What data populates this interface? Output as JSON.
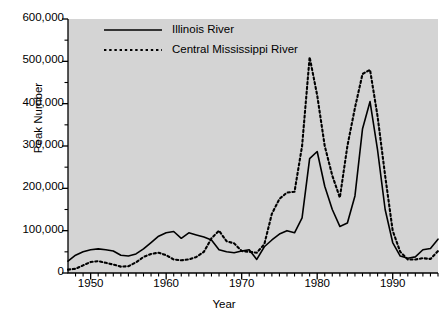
{
  "chart_data": {
    "type": "line",
    "title": "",
    "xlabel": "Year",
    "ylabel": "Peak Number",
    "xlim": [
      1947,
      1996
    ],
    "ylim": [
      0,
      600000
    ],
    "grid": false,
    "legend_position": "top-center",
    "y_ticks": [
      0,
      100000,
      200000,
      300000,
      400000,
      500000,
      600000
    ],
    "y_tick_labels": [
      "0",
      "100,000",
      "200,000",
      "300,000",
      "400,000",
      "500,000",
      "600,000"
    ],
    "x_ticks": [
      1950,
      1960,
      1970,
      1980,
      1990
    ],
    "x_tick_labels": [
      "1950",
      "1960",
      "1970",
      "1980",
      "1990"
    ],
    "x_minor_tick_interval": 1,
    "background_color": "#d4d4d4",
    "series": [
      {
        "name": "Illinois River",
        "style": "solid",
        "color": "#000000",
        "x": [
          1947,
          1948,
          1949,
          1950,
          1951,
          1952,
          1953,
          1954,
          1955,
          1956,
          1957,
          1958,
          1959,
          1960,
          1961,
          1962,
          1963,
          1964,
          1965,
          1966,
          1967,
          1968,
          1969,
          1970,
          1971,
          1972,
          1973,
          1974,
          1975,
          1976,
          1977,
          1978,
          1979,
          1980,
          1981,
          1982,
          1983,
          1984,
          1985,
          1986,
          1987,
          1988,
          1989,
          1990,
          1991,
          1992,
          1993,
          1994,
          1995,
          1996
        ],
        "values": [
          28000,
          42000,
          50000,
          55000,
          57000,
          55000,
          52000,
          42000,
          40000,
          45000,
          57000,
          72000,
          87000,
          95000,
          98000,
          82000,
          95000,
          90000,
          85000,
          78000,
          55000,
          50000,
          48000,
          52000,
          55000,
          32000,
          62000,
          78000,
          92000,
          100000,
          95000,
          130000,
          270000,
          287000,
          205000,
          150000,
          110000,
          118000,
          182000,
          340000,
          405000,
          290000,
          150000,
          72000,
          40000,
          35000,
          38000,
          55000,
          58000,
          80000
        ]
      },
      {
        "name": "Central Mississippi River",
        "style": "dotted",
        "color": "#000000",
        "x": [
          1947,
          1948,
          1949,
          1950,
          1951,
          1952,
          1953,
          1954,
          1955,
          1956,
          1957,
          1958,
          1959,
          1960,
          1961,
          1962,
          1963,
          1964,
          1965,
          1966,
          1967,
          1968,
          1969,
          1970,
          1971,
          1972,
          1973,
          1974,
          1975,
          1976,
          1977,
          1978,
          1979,
          1980,
          1981,
          1982,
          1983,
          1984,
          1985,
          1986,
          1987,
          1988,
          1989,
          1990,
          1991,
          1992,
          1993,
          1994,
          1995,
          1996
        ],
        "values": [
          8000,
          10000,
          18000,
          26000,
          28000,
          24000,
          20000,
          15000,
          16000,
          25000,
          38000,
          45000,
          48000,
          42000,
          32000,
          30000,
          32000,
          38000,
          50000,
          82000,
          100000,
          75000,
          70000,
          52000,
          50000,
          48000,
          68000,
          140000,
          175000,
          190000,
          192000,
          300000,
          510000,
          420000,
          300000,
          230000,
          178000,
          300000,
          390000,
          470000,
          480000,
          370000,
          230000,
          100000,
          50000,
          32000,
          32000,
          35000,
          33000,
          52000
        ]
      }
    ]
  },
  "axes": {
    "ylabel": "Peak Number",
    "xlabel": "Year"
  },
  "legend": {
    "entries": [
      {
        "label": "Illinois River",
        "style": "solid"
      },
      {
        "label": "Central Mississippi River",
        "style": "dotted"
      }
    ]
  }
}
